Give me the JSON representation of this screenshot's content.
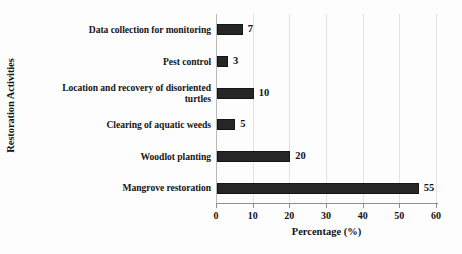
{
  "chart_data": {
    "type": "bar",
    "orientation": "horizontal",
    "title": "",
    "xlabel": "Percentage (%)",
    "ylabel": "Restoration Activities",
    "xlim": [
      0,
      60
    ],
    "xticks": [
      0,
      10,
      20,
      30,
      40,
      50,
      60
    ],
    "xtick_labels": [
      "0",
      "10",
      "20",
      "30",
      "40",
      "50",
      "60"
    ],
    "grid": "vertical",
    "legend": "none",
    "bar_color": "#262626",
    "categories": [
      "Data collection for monitoring",
      "Pest control",
      "Location and recovery of disoriented turtles",
      "Clearing of aquatic weeds",
      "Woodlot planting",
      "Mangrove restoration"
    ],
    "category_lines": [
      [
        "Data collection for monitoring"
      ],
      [
        "Pest control"
      ],
      [
        "Location and recovery of disoriented",
        "turtles"
      ],
      [
        "Clearing of aquatic weeds"
      ],
      [
        "Woodlot planting"
      ],
      [
        "Mangrove restoration"
      ]
    ],
    "values": [
      7,
      3,
      10,
      5,
      20,
      55
    ],
    "data_labels": [
      "7",
      "3",
      "10",
      "5",
      "20",
      "55"
    ]
  }
}
